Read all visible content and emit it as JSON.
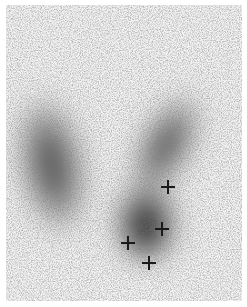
{
  "image": {
    "subject": "thyroid scintigraphy scan",
    "background_color": "#d9d9d9",
    "uptake_color": "#2a2a2a",
    "regions": [
      {
        "name": "left-lobe",
        "cx": 52,
        "cy": 165,
        "rx": 34,
        "ry": 75,
        "rotate": -15
      },
      {
        "name": "right-lobe-upper",
        "cx": 160,
        "cy": 150,
        "rx": 28,
        "ry": 65,
        "rotate": 30
      },
      {
        "name": "right-lobe-lower-hot",
        "cx": 145,
        "cy": 215,
        "rx": 32,
        "ry": 40,
        "rotate": 0
      }
    ],
    "markers": [
      {
        "name": "marker-1",
        "x": 168,
        "y": 187
      },
      {
        "name": "marker-2",
        "x": 162,
        "y": 229
      },
      {
        "name": "marker-3",
        "x": 128,
        "y": 243
      },
      {
        "name": "marker-4",
        "x": 149,
        "y": 263
      }
    ]
  }
}
